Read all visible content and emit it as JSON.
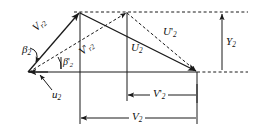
{
  "figure": {
    "kind": "velocity-triangle-diagram",
    "background_color": "#ffffff",
    "stroke_color": "#1a1a1a",
    "labels": {
      "v_r2": {
        "base": "V",
        "sub": "r2",
        "prime": "",
        "text": "V r2"
      },
      "vp_r2": {
        "base": "V",
        "sub": "r2",
        "prime": "'",
        "text": "V' r2"
      },
      "u2_big": {
        "base": "U",
        "sub": "2",
        "prime": "",
        "text": "U 2"
      },
      "up2_big": {
        "base": "U",
        "sub": "2",
        "prime": "'",
        "text": "U' 2"
      },
      "u2_small": {
        "base": "u",
        "sub": "2",
        "prime": "",
        "text": "u 2"
      },
      "beta2": {
        "base": "β",
        "sub": "2",
        "prime": "",
        "text": "β 2"
      },
      "beta_p2": {
        "base": "β",
        "sub": "2",
        "prime": "'",
        "text": "β' 2"
      },
      "v2": {
        "base": "V",
        "sub": "2",
        "prime": "",
        "text": "V 2"
      },
      "vp2": {
        "base": "V",
        "sub": "2",
        "prime": "'",
        "text": "V' 2"
      },
      "y2": {
        "base": "Y",
        "sub": "2",
        "prime": "",
        "text": "Y 2"
      }
    },
    "geometry": {
      "left_vertex": [
        28,
        72
      ],
      "apex_solid": [
        80,
        12
      ],
      "apex_dashed": [
        127,
        12
      ],
      "right_vertex": [
        197,
        72
      ],
      "baseline_y": 72,
      "top_dashed_y": 12,
      "dim_vp2_y": 95,
      "dim_v2_y": 118,
      "dim_y2_x": 222
    }
  }
}
